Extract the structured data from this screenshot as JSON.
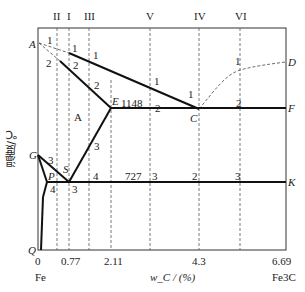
{
  "diagram": {
    "y_axis_label": "温度/℃",
    "x_axis_label": "w_C / (%)",
    "x_ticks": [
      "0",
      "0.77",
      "2.11",
      "4.3",
      "6.69"
    ],
    "x_end_labels": {
      "left": "Fe",
      "right": "Fe3C"
    },
    "points": {
      "A": "A",
      "C": "C",
      "D": "D",
      "E": "E",
      "F": "F",
      "G": "G",
      "P": "P",
      "S": "S",
      "K": "K",
      "Q": "Q"
    },
    "temperatures": {
      "eutectic": "1148",
      "eutectoid": "727"
    },
    "region_label": "A",
    "alloy_lines": [
      "II",
      "I",
      "III",
      "V",
      "IV",
      "VI"
    ],
    "segment_numbers": {
      "n1": "1",
      "n2": "2",
      "n3": "3",
      "n4": "4"
    }
  }
}
